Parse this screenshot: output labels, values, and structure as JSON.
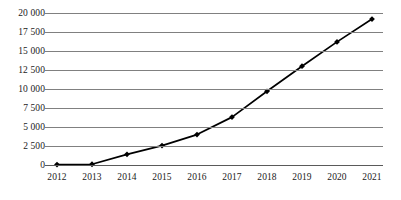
{
  "chart_data": {
    "type": "line",
    "title": "",
    "subtitle": "",
    "xlabel": "",
    "ylabel": "",
    "categories": [
      "2012",
      "2013",
      "2014",
      "2015",
      "2016",
      "2017",
      "2018",
      "2019",
      "2020",
      "2021"
    ],
    "x": [
      2012,
      2013,
      2014,
      2015,
      2016,
      2017,
      2018,
      2019,
      2020,
      2021
    ],
    "values": [
      50,
      100,
      1400,
      2550,
      4000,
      6300,
      9700,
      13000,
      16200,
      19200
    ],
    "series": [
      {
        "name": "series-1",
        "values": [
          50,
          100,
          1400,
          2550,
          4000,
          6300,
          9700,
          13000,
          16200,
          19200
        ]
      }
    ],
    "ylim": [
      0,
      20000
    ],
    "ytick_values": [
      0,
      2500,
      5000,
      7500,
      10000,
      12500,
      15000,
      17500,
      20000
    ],
    "ytick_labels": [
      "0",
      "2 500",
      "5 000",
      "7 500",
      "10 000",
      "12 500",
      "15 000",
      "17 500",
      "20 000"
    ],
    "xtick_labels": [
      "2012",
      "2013",
      "2014",
      "2015",
      "2016",
      "2017",
      "2018",
      "2019",
      "2020",
      "2021"
    ],
    "grid": true,
    "grid_axis": "y",
    "legend": false,
    "legend_position": "none",
    "marker": "diamond",
    "colors": {
      "line": "#000000",
      "marker": "#000000",
      "gridline": "#808080",
      "axis": "#5a5a5a",
      "text": "#1a1a1a",
      "background": "#ffffff"
    }
  }
}
